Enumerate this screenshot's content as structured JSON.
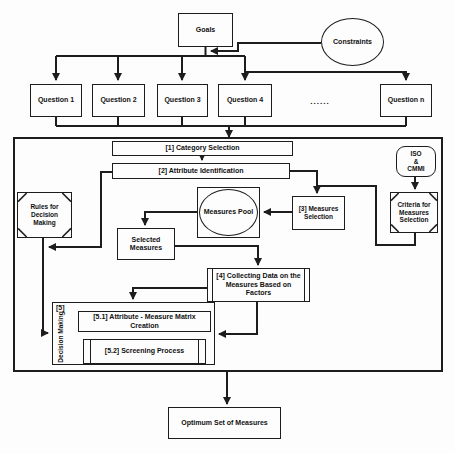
{
  "colors": {
    "ink": "#1d1d1d",
    "background": "#fdfdfd"
  },
  "nodes": {
    "goals": {
      "label": "Goals"
    },
    "constraints": {
      "label": "Constraints"
    },
    "questions": [
      {
        "label": "Question 1"
      },
      {
        "label": "Question 2"
      },
      {
        "label": "Question 3"
      },
      {
        "label": "Question 4"
      },
      {
        "label": "Question n"
      }
    ],
    "ellipsis": "......",
    "step1": {
      "label": "[1] Category Selection"
    },
    "step2": {
      "label": "[2] Attribute Identification"
    },
    "iso_cmmi": {
      "lines": [
        "ISO",
        "&",
        "CMMI"
      ]
    },
    "criteria": {
      "label": "Criteria for Measures Selection"
    },
    "rules": {
      "label": "Rules for Decision Making"
    },
    "measures_pool": {
      "label": "Measures Pool"
    },
    "step3": {
      "label": "[3] Measures Selection"
    },
    "selected_measures": {
      "label": "Selected Measures"
    },
    "step4": {
      "label": "[4] Collecting Data on the Measures Based on Factors"
    },
    "step5": {
      "tag": "[5]",
      "side_label": "Decision Making"
    },
    "step5_1": {
      "label": "[5.1] Attribute - Measure Matrix Creation"
    },
    "step5_2": {
      "label": "[5.2] Screening Process"
    },
    "optimum": {
      "label": "Optimum Set of Measures"
    }
  }
}
